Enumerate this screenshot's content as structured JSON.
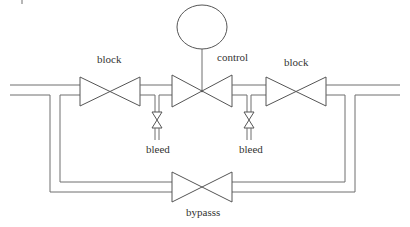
{
  "diagram": {
    "type": "piping-schematic",
    "labels": {
      "left_block": "block",
      "control": "control",
      "right_block": "block",
      "left_bleed": "bleed",
      "right_bleed": "bleed",
      "bypass": "bypasss"
    },
    "components": [
      {
        "id": "left-block-valve",
        "kind": "gate-valve",
        "label": "block"
      },
      {
        "id": "control-valve",
        "kind": "control-valve",
        "label": "control",
        "actuator": "circle"
      },
      {
        "id": "right-block-valve",
        "kind": "gate-valve",
        "label": "block"
      },
      {
        "id": "left-bleed-valve",
        "kind": "bleed-valve",
        "label": "bleed"
      },
      {
        "id": "right-bleed-valve",
        "kind": "bleed-valve",
        "label": "bleed"
      },
      {
        "id": "bypass-valve",
        "kind": "gate-valve",
        "label": "bypasss"
      }
    ],
    "colors": {
      "line": "#6e6e6e",
      "text": "#333333",
      "background": "#ffffff"
    }
  }
}
